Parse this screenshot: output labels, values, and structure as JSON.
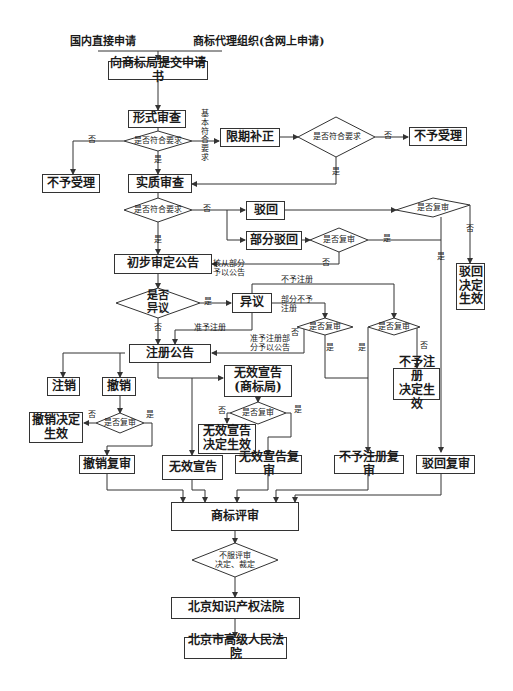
{
  "header": {
    "left_source": "国内直接申请",
    "right_source": "商标代理组织(含网上申请)"
  },
  "boxes": {
    "submit": "向商标局提交申请书",
    "formal_exam": "形式审查",
    "reject_accept_left": "不予受理",
    "limited_correction": "限期补正",
    "reject_accept_right": "不予受理",
    "substantive_exam": "实质审查",
    "reject": "驳回",
    "partial_reject": "部分驳回",
    "reject_effective": "驳回\n决定\n生效",
    "preliminary_announcement": "初步审定公告",
    "opposition": "异议",
    "registration_announcement": "注册公告",
    "cancel": "注销",
    "revoke": "撤销",
    "invalid_declaration_office": "无效宣告\n(商标局)",
    "revoke_effective": "撤销决定\n生效",
    "invalid_effective": "无效宣告\n决定生效",
    "no_registration_effective": "不予注册\n决定生效",
    "revoke_review": "撤销复审",
    "invalid_declaration": "无效宣告",
    "invalid_review": "无效宣告复审",
    "no_registration_review": "不予注册复审",
    "reject_review": "驳回复审",
    "trademark_review": "商标评审",
    "beijing_ip_court": "北京知识产权法院",
    "beijing_high_court": "北京市高级人民法院"
  },
  "decisions": {
    "meets_req_1": "是否符合要求",
    "meets_req_2": "是否符合要求",
    "meets_req_3": "是否符合要求",
    "review_reject": "是否复审",
    "review_partial": "是否复审",
    "has_opposition": "是否\n异议",
    "review_opp_partial": "是否复审",
    "review_opp_no_reg": "是否复审",
    "review_revoke": "是否复审",
    "review_invalid": "是否复审",
    "dissatisfied": "不服评审\n决定、裁定"
  },
  "edge_labels": {
    "yes": "是",
    "no": "否",
    "basically_meets": "基\n本\n符\n合\n要\n求",
    "partial_approved": "核从部分\n予以公告",
    "no_registration": "不予注册",
    "partial_no_registration": "部分不予\n注册",
    "approved_registration": "准予注册",
    "partial_approved_registration": "准予注册部\n分予以公告"
  }
}
